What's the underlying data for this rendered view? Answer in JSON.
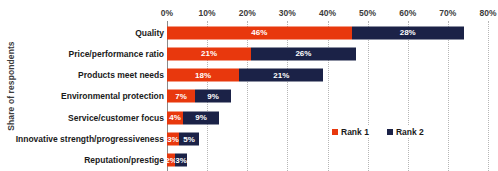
{
  "chart_data": {
    "type": "bar",
    "orientation": "horizontal",
    "stacked": true,
    "title": "",
    "xlabel": "",
    "ylabel": "Share of respondents",
    "xlim": [
      0,
      80
    ],
    "xtick_labels": [
      "0%",
      "10%",
      "20%",
      "30%",
      "40%",
      "50%",
      "60%",
      "70%",
      "80%"
    ],
    "xtick_values": [
      0,
      10,
      20,
      30,
      40,
      50,
      60,
      70,
      80
    ],
    "grid": true,
    "grid_axis": "x",
    "legend_position": "inside-lower-right",
    "categories": [
      "Quality",
      "Price/performance ratio",
      "Products meet needs",
      "Environmental protection",
      "Service/customer focus",
      "Innovative strength/progressiveness",
      "Reputation/prestige"
    ],
    "series": [
      {
        "name": "Rank 1",
        "color": "#e8380d",
        "values": [
          46,
          21,
          18,
          7,
          4,
          3,
          2
        ],
        "labels": [
          "46%",
          "21%",
          "18%",
          "7%",
          "4%",
          "3%",
          "2%"
        ]
      },
      {
        "name": "Rank 2",
        "color": "#1b2247",
        "values": [
          28,
          26,
          21,
          9,
          9,
          5,
          3
        ],
        "labels": [
          "28%",
          "26%",
          "21%",
          "9%",
          "9%",
          "5%",
          "3%"
        ]
      }
    ]
  },
  "legend": {
    "items": [
      {
        "label": "Rank 1",
        "color": "#e8380d"
      },
      {
        "label": "Rank 2",
        "color": "#1b2247"
      }
    ]
  },
  "axis": {
    "y_title": "Share of respondents"
  }
}
